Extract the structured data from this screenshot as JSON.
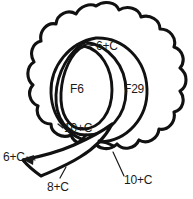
{
  "figure": {
    "type": "line-drawing",
    "stroke_color": "#111111",
    "background_color": "#ffffff",
    "text_color": "#1a1a1a"
  },
  "part_labels": [
    {
      "id": "f6",
      "text": "F6"
    },
    {
      "id": "f29",
      "text": "F29"
    }
  ],
  "callouts": [
    {
      "id": "top",
      "text": "6+C"
    },
    {
      "id": "bottom_inner",
      "text": "10+C"
    },
    {
      "id": "left_leaf_tip",
      "text": "6+C"
    },
    {
      "id": "stem",
      "text": "8+C"
    },
    {
      "id": "bottom_right",
      "text": "10+C"
    }
  ]
}
